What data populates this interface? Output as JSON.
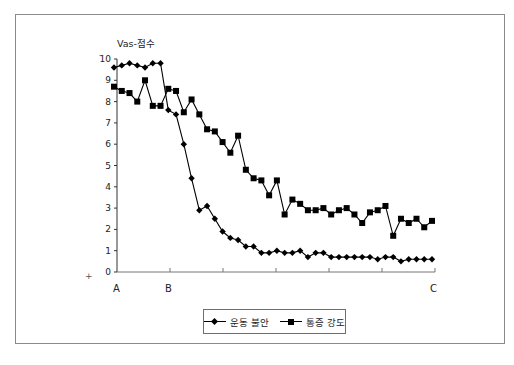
{
  "chart_data": {
    "type": "line",
    "title": "",
    "ylabel": "Vas-점수",
    "xlabel": "",
    "ylim": [
      0,
      10
    ],
    "yticks": [
      0,
      1,
      2,
      3,
      4,
      5,
      6,
      7,
      8,
      9,
      10
    ],
    "x_category_labels": [
      "A",
      "B",
      "C"
    ],
    "grid": false,
    "legend_position": "bottom",
    "series": [
      {
        "name": "운동 불안",
        "marker": "diamond",
        "values": [
          9.6,
          9.7,
          9.8,
          9.7,
          9.6,
          9.8,
          9.8,
          7.6,
          7.4,
          6.0,
          4.4,
          2.9,
          3.1,
          2.5,
          1.9,
          1.6,
          1.5,
          1.2,
          1.2,
          0.9,
          0.9,
          1.0,
          0.9,
          0.9,
          1.0,
          0.7,
          0.9,
          0.9,
          0.7,
          0.7,
          0.7,
          0.7,
          0.7,
          0.7,
          0.6,
          0.7,
          0.7,
          0.5,
          0.6,
          0.6,
          0.6,
          0.6
        ]
      },
      {
        "name": "통증 강도",
        "marker": "square",
        "values": [
          8.7,
          8.5,
          8.4,
          8.0,
          9.0,
          7.8,
          7.8,
          8.6,
          8.5,
          7.5,
          8.1,
          7.4,
          6.7,
          6.6,
          6.1,
          5.6,
          6.4,
          4.8,
          4.4,
          4.3,
          3.6,
          4.3,
          2.7,
          3.4,
          3.2,
          2.9,
          2.9,
          3.0,
          2.7,
          2.9,
          3.0,
          2.7,
          2.3,
          2.8,
          2.9,
          3.1,
          1.7,
          2.5,
          2.3,
          2.5,
          2.1,
          2.4
        ]
      }
    ]
  },
  "legend": {
    "items": [
      {
        "label": "운동 불안",
        "marker": "diamond"
      },
      {
        "label": "통증 강도",
        "marker": "square"
      }
    ]
  },
  "axis": {
    "y_title": "Vas-점수",
    "x_labels": {
      "start": "A",
      "mid": "B",
      "end": "C"
    }
  }
}
